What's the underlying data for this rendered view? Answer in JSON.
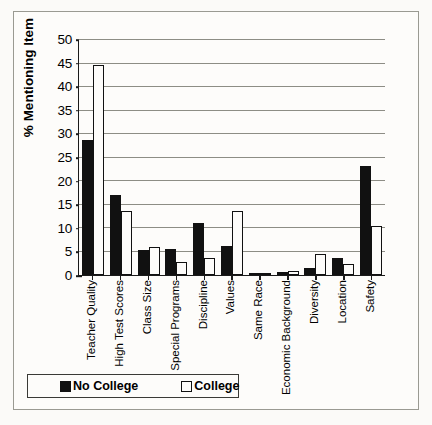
{
  "chart_data": {
    "type": "bar",
    "title": "",
    "xlabel": "",
    "ylabel": "% Mentioning Item",
    "ylim": [
      0,
      50
    ],
    "ytick_step": 5,
    "yticks": [
      0,
      5,
      10,
      15,
      20,
      25,
      30,
      35,
      40,
      45,
      50
    ],
    "grid": true,
    "legend_position": "bottom",
    "categories": [
      "Teacher Quality",
      "High Test Scores",
      "Class Size",
      "Special Programs",
      "Discipline",
      "Values",
      "Same Race",
      "Economic Background",
      "Diversity",
      "Location",
      "Safety"
    ],
    "series": [
      {
        "name": "No College",
        "color": "#111111",
        "values": [
          28.5,
          17.0,
          5.2,
          5.5,
          11.0,
          6.1,
          0.5,
          0.7,
          1.5,
          3.5,
          23.0
        ]
      },
      {
        "name": "College",
        "color": "#ffffff",
        "values": [
          44.5,
          13.5,
          5.9,
          2.8,
          3.6,
          13.5,
          0.5,
          0.8,
          4.4,
          2.3,
          10.3
        ]
      }
    ]
  },
  "legend": {
    "entries": [
      {
        "label": "No College",
        "swatch": "dark"
      },
      {
        "label": "College",
        "swatch": "light"
      }
    ]
  }
}
